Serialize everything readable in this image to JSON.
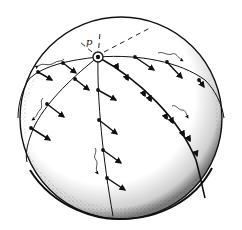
{
  "figure": {
    "title": "",
    "pole_label": "p",
    "colors": {
      "ink": "#111111",
      "paper": "#ffffff"
    }
  }
}
